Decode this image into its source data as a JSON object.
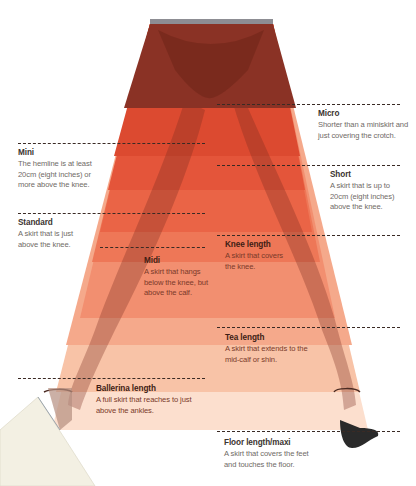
{
  "diagram": {
    "colors": {
      "micro": "#8a3124",
      "mini": "#d9452c",
      "short": "#e6533a",
      "standard": "#ec6a4c",
      "knee": "#f07f5f",
      "midi": "#f3906f",
      "tea": "#f6a486",
      "ballerina": "#f8c2a6",
      "floor": "#fbd6c2",
      "waistband": "#8d8d93",
      "dash": "#3a2a24"
    },
    "lengths": [
      {
        "id": "micro",
        "title": "Micro",
        "desc": "Shorter than a miniskirt and just covering the crotch."
      },
      {
        "id": "mini",
        "title": "Mini",
        "desc": "The hemline is at least 20cm (eight inches) or more above the knee."
      },
      {
        "id": "short",
        "title": "Short",
        "desc": "A skirt that is up to 20cm (eight inches) above the knee."
      },
      {
        "id": "standard",
        "title": "Standard",
        "desc": "A skirt that is just above the knee."
      },
      {
        "id": "knee",
        "title": "Knee length",
        "desc": "A skirt that covers the knee."
      },
      {
        "id": "midi",
        "title": "Midi",
        "desc": "A skirt that hangs below the knee, but above the calf."
      },
      {
        "id": "tea",
        "title": "Tea length",
        "desc": "A skirt that extends to the mid-calf or shin."
      },
      {
        "id": "ballerina",
        "title": "Ballerina length",
        "desc": "A full skirt that reaches to just above the ankles."
      },
      {
        "id": "floor",
        "title": "Floor length/maxi",
        "desc": "A skirt that covers the feet and touches the floor."
      }
    ]
  }
}
